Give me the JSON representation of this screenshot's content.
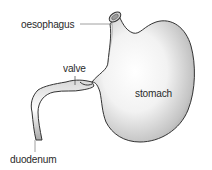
{
  "diagram": {
    "labels": {
      "oesophagus": "oesophagus",
      "valve": "valve",
      "stomach": "stomach",
      "duodenum": "duodenum"
    },
    "colors": {
      "outline": "#333333",
      "fill_light": "#ffffff",
      "fill_dark": "#9a9a9a",
      "leader_line": "#888888",
      "text": "#2a2a2a"
    }
  }
}
